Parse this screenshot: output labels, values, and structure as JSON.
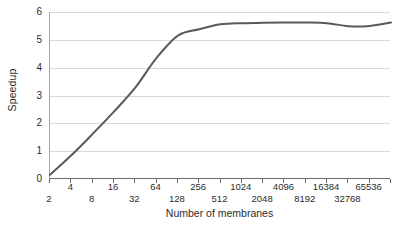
{
  "chart_data": {
    "type": "line",
    "title": "",
    "xlabel": "Number of membranes",
    "ylabel": "Speedup",
    "xscale": "log2",
    "xlim": [
      2,
      131072
    ],
    "ylim": [
      0,
      6
    ],
    "grid": true,
    "legend": false,
    "line_color": "#595959",
    "grid_color": "#d9d9d9",
    "axis_color": "#6e6e6e",
    "y_ticks": [
      0,
      1,
      2,
      3,
      4,
      5,
      6
    ],
    "y_tick_labels": [
      "0",
      "1",
      "2",
      "3",
      "4",
      "5",
      "6"
    ],
    "x_ticks": [
      2,
      4,
      8,
      16,
      32,
      64,
      128,
      256,
      512,
      1024,
      2048,
      4096,
      8192,
      16384,
      32768,
      65536,
      131072
    ],
    "x_tick_labels_upper": [
      "4",
      "16",
      "64",
      "256",
      "1024",
      "4096",
      "16384",
      "65536"
    ],
    "x_tick_labels_lower": [
      "2",
      "8",
      "32",
      "128",
      "512",
      "2048",
      "8192",
      "32768"
    ],
    "x": [
      2,
      4,
      8,
      16,
      32,
      64,
      128,
      256,
      512,
      1024,
      2048,
      4096,
      8192,
      16384,
      32768,
      65536,
      131072
    ],
    "values": [
      0.15,
      0.85,
      1.62,
      2.42,
      3.28,
      4.35,
      5.15,
      5.38,
      5.56,
      5.6,
      5.61,
      5.62,
      5.62,
      5.6,
      5.49,
      5.5,
      5.62
    ],
    "series": [
      {
        "name": "Speedup",
        "values": [
          0.15,
          0.85,
          1.62,
          2.42,
          3.28,
          4.35,
          5.15,
          5.38,
          5.56,
          5.6,
          5.61,
          5.62,
          5.62,
          5.6,
          5.49,
          5.5,
          5.62
        ]
      }
    ]
  }
}
